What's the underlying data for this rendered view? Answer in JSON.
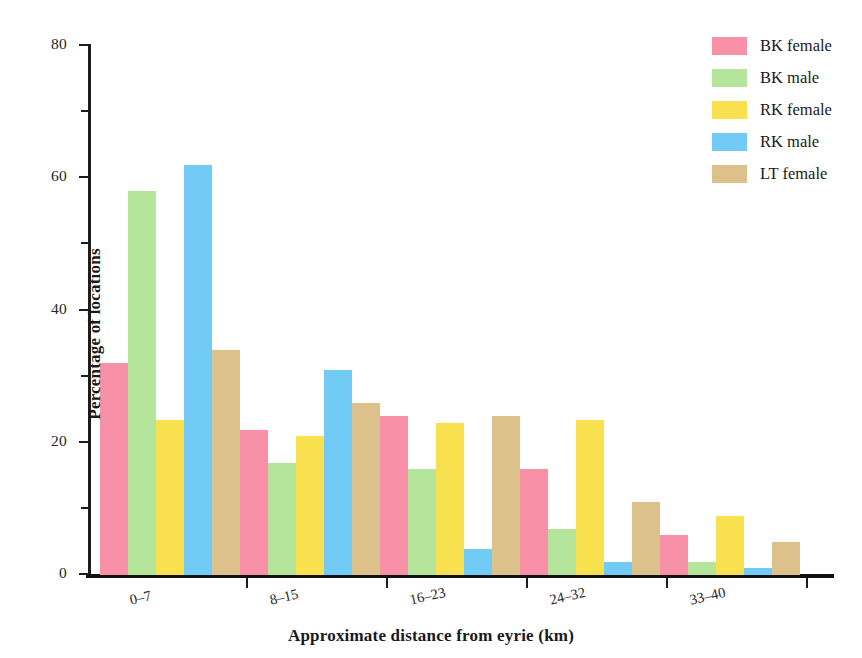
{
  "chart_data": {
    "type": "bar",
    "title": "",
    "xlabel": "Approximate distance from eyrie (km)",
    "ylabel": "Percentage of locations",
    "categories": [
      "0–7",
      "8–15",
      "16–23",
      "24–32",
      "33–40"
    ],
    "series": [
      {
        "name": "BK female",
        "color": "#F891A8",
        "values": [
          32,
          22,
          24,
          16,
          6
        ]
      },
      {
        "name": "BK male",
        "color": "#B5E59A",
        "values": [
          58,
          17,
          16,
          7,
          2
        ]
      },
      {
        "name": "RK female",
        "color": "#F9E04E",
        "values": [
          23.5,
          21,
          23,
          23.5,
          9
        ]
      },
      {
        "name": "RK male",
        "color": "#71CBF4",
        "values": [
          62,
          31,
          4,
          2,
          1
        ]
      },
      {
        "name": "LT female",
        "color": "#DCC28A",
        "values": [
          34,
          26,
          24,
          11,
          5
        ]
      }
    ],
    "ylim": [
      0,
      80
    ],
    "y_major_ticks": [
      0,
      20,
      40,
      60,
      80
    ],
    "y_minor_ticks": [
      10,
      30,
      50,
      70
    ],
    "y_tick_labels": [
      "0",
      "20",
      "40",
      "60",
      "80"
    ],
    "grid": false,
    "legend_position": "top-right"
  },
  "legend": {
    "entries": [
      {
        "label": "BK female",
        "color": "#F891A8"
      },
      {
        "label": "BK male",
        "color": "#B5E59A"
      },
      {
        "label": "RK female",
        "color": "#F9E04E"
      },
      {
        "label": "RK male",
        "color": "#71CBF4"
      },
      {
        "label": "LT female",
        "color": "#DCC28A"
      }
    ]
  }
}
